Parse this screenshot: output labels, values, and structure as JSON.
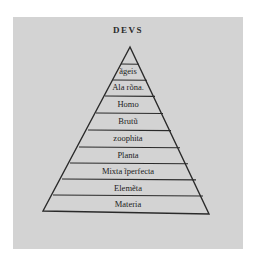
{
  "diagram": {
    "title": "DEVS",
    "type": "hierarchical-pyramid",
    "levels": [
      {
        "label": "ãgeis"
      },
      {
        "label": "Ala rõna."
      },
      {
        "label": "Homo"
      },
      {
        "label": "Brutũ"
      },
      {
        "label": "zoophita"
      },
      {
        "label": "Planta"
      },
      {
        "label": "Mixta ĩperfecta"
      },
      {
        "label": "Elemẽta"
      },
      {
        "label": "Materia"
      }
    ],
    "colors": {
      "plate": "#d3d3d3",
      "ink": "#2a2a2a",
      "background": "#ffffff"
    }
  }
}
